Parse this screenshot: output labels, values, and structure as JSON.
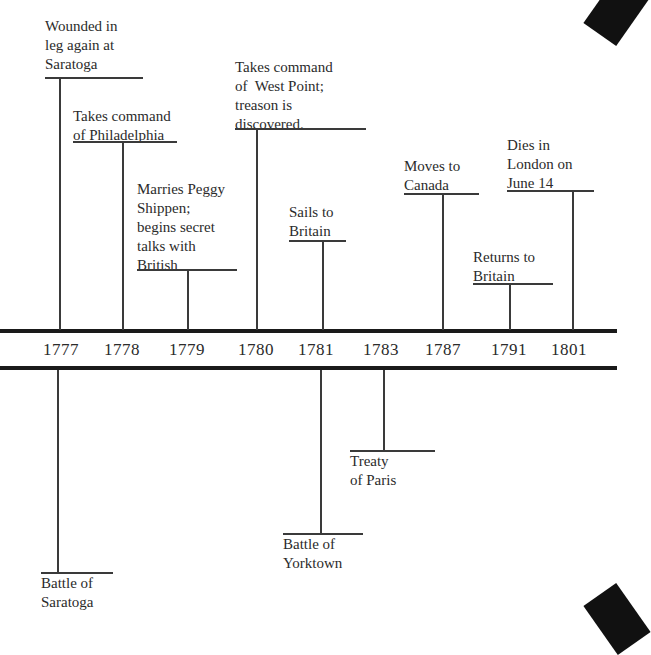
{
  "timeline": {
    "years": [
      {
        "label": "1777",
        "x": 59
      },
      {
        "label": "1778",
        "x": 122
      },
      {
        "label": "1779",
        "x": 188
      },
      {
        "label": "1780",
        "x": 256
      },
      {
        "label": "1781",
        "x": 322
      },
      {
        "label": "1783",
        "x": 384
      },
      {
        "label": "1787",
        "x": 442
      },
      {
        "label": "1791",
        "x": 509
      },
      {
        "label": "1801",
        "x": 571
      }
    ],
    "above": [
      {
        "year": "1777",
        "text": "Wounded in\nleg again at\nSaratoga"
      },
      {
        "year": "1778",
        "text": "Takes command\nof Philadelphia"
      },
      {
        "year": "1779",
        "text": "Marries Peggy\nShippen;\nbegins secret\ntalks with\nBritish"
      },
      {
        "year": "1780",
        "text": "Takes command\nof  West Point;\ntreason is\ndiscovered."
      },
      {
        "year": "1781",
        "text": "Sails to\nBritain"
      },
      {
        "year": "1787",
        "text": "Moves to\nCanada"
      },
      {
        "year": "1791",
        "text": "Returns to\nBritain"
      },
      {
        "year": "1801",
        "text": "Dies in\nLondon on\nJune 14"
      }
    ],
    "below": [
      {
        "year": "1777",
        "text": "Battle of\nSaratoga"
      },
      {
        "year": "1781",
        "text": "Battle of\nYorktown"
      },
      {
        "year": "1783",
        "text": "Treaty\nof Paris"
      }
    ]
  }
}
